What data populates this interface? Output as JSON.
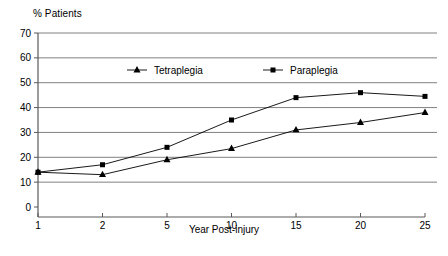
{
  "chart_data": {
    "type": "line",
    "title": "",
    "xlabel": "Year Post-injury",
    "ylabel": "% Patients",
    "categories": [
      "1",
      "2",
      "5",
      "10",
      "15",
      "20",
      "25"
    ],
    "ylim": [
      0,
      70
    ],
    "ytick_step": 10,
    "yticks": [
      "0",
      "10",
      "20",
      "30",
      "40",
      "50",
      "60",
      "70"
    ],
    "grid": "horizontal",
    "legend_position": "inside-top-center",
    "series": [
      {
        "name": "Tetraplegia",
        "marker": "triangle",
        "color": "#000000",
        "values": [
          14,
          13,
          19,
          23.5,
          31,
          34,
          38
        ]
      },
      {
        "name": "Paraplegia",
        "marker": "square",
        "color": "#000000",
        "values": [
          14,
          17,
          24,
          35,
          44,
          46,
          44.5
        ]
      }
    ]
  },
  "axis": {
    "y_label_text": "% Patients",
    "x_label_text": "Year Post-injury"
  },
  "colors": {
    "grid": "#808080",
    "axis": "#595959",
    "series": "#000000",
    "background": "#ffffff"
  }
}
